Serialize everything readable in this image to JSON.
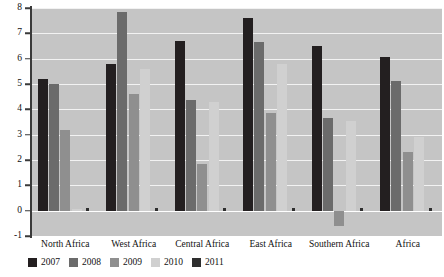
{
  "chart_data": {
    "type": "bar",
    "title": "",
    "xlabel": "",
    "ylabel": "",
    "ylim": [
      -1,
      8
    ],
    "yticks": [
      -1,
      0,
      1,
      2,
      3,
      4,
      5,
      6,
      7,
      8
    ],
    "ytick_labels": [
      "-1",
      "0",
      "1",
      "2",
      "3",
      "4",
      "5",
      "6",
      "7",
      "8"
    ],
    "grid": true,
    "legend_position": "bottom",
    "categories": [
      "North Africa",
      "West Africa",
      "Central Africa",
      "East Africa",
      "Southern Africa",
      "Africa"
    ],
    "series": [
      {
        "name": "2007",
        "color": "#231f20",
        "values": [
          5.2,
          5.8,
          6.7,
          7.6,
          6.5,
          6.05
        ]
      },
      {
        "name": "2008",
        "color": "#6b6b6b",
        "values": [
          5.0,
          7.85,
          4.35,
          6.65,
          3.65,
          5.1
        ]
      },
      {
        "name": "2009",
        "color": "#8f8f8f",
        "values": [
          3.2,
          4.6,
          1.85,
          3.85,
          -0.6,
          2.3
        ]
      },
      {
        "name": "2010",
        "color": "#d0d0d0",
        "values": [
          0.05,
          5.6,
          4.3,
          5.8,
          3.55,
          2.9
        ]
      },
      {
        "name": "2011",
        "color": "#2e2e2e",
        "values": [
          0.12,
          0.12,
          0.12,
          0.12,
          0.12,
          0.12
        ]
      }
    ]
  },
  "colors": {
    "plot_background": "#c5c5c5",
    "gridline": "#f2f2f2",
    "axis": "#3a3a3a",
    "page_background": "#ffffff"
  }
}
